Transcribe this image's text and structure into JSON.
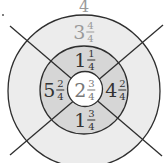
{
  "diagram": {
    "top_label": "4",
    "dot": true,
    "colors": {
      "outer_ring": "#ececec",
      "middle_ring": "#d6d6d6",
      "inner_circle": "#ffffff",
      "stroke": "#2e2e2e",
      "dark_text": "#333333",
      "light_text": "#9a9a9a"
    },
    "rings": {
      "center": {
        "whole": "2",
        "num": "3",
        "den": "4"
      },
      "middle_top": {
        "whole": "1",
        "num": "1",
        "den": "4"
      },
      "middle_bottom": {
        "whole": "1",
        "num": "3",
        "den": "4"
      },
      "middle_left": {
        "whole": "5",
        "num": "2",
        "den": "4"
      },
      "middle_right": {
        "whole": "4",
        "num": "2",
        "den": "4"
      },
      "outer_top": {
        "whole": "3",
        "num": "4",
        "den": "4"
      }
    }
  }
}
